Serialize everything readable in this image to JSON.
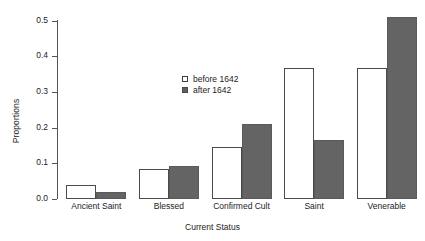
{
  "chart_data": {
    "type": "bar",
    "title": "",
    "subtitle": "",
    "xlabel": "Current Status",
    "ylabel": "Proportions",
    "categories": [
      "Ancient Saint",
      "Blessed",
      "Confirmed Cult",
      "Saint",
      "Venerable"
    ],
    "series": [
      {
        "name": "before 1642",
        "color": "#ffffff",
        "values": [
          0.04,
          0.085,
          0.145,
          0.368,
          0.368
        ]
      },
      {
        "name": "after 1642",
        "color": "#646464",
        "values": [
          0.02,
          0.093,
          0.21,
          0.165,
          0.51
        ]
      }
    ],
    "ylim": [
      0.0,
      0.5
    ],
    "yticks": [
      0.0,
      0.1,
      0.2,
      0.3,
      0.4,
      0.5
    ],
    "ytick_labels": [
      "0.0",
      "0.1",
      "0.2",
      "0.3",
      "0.4",
      "0.5"
    ],
    "grid": false,
    "legend_position": "center",
    "legend_entries": [
      "before 1642",
      "after 1642"
    ]
  }
}
